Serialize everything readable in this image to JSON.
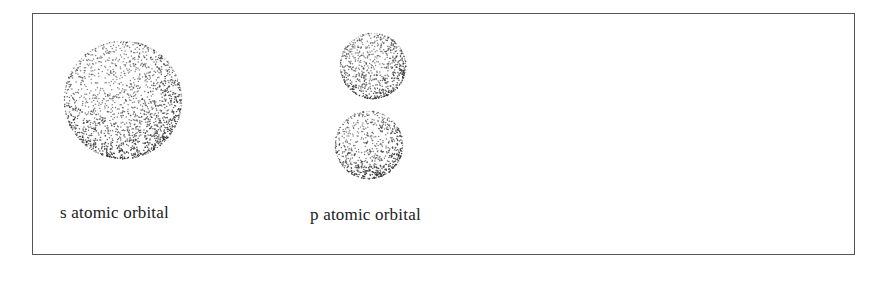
{
  "figure": {
    "orbitals": [
      {
        "id": "s",
        "label": "s atomic orbital",
        "shape": "sphere",
        "lobes": [
          {
            "cx": 123,
            "cy": 100,
            "r": 59
          }
        ],
        "label_pos": {
          "x": 60,
          "y": 203
        }
      },
      {
        "id": "p",
        "label": "p atomic orbital",
        "shape": "dumbbell",
        "lobes": [
          {
            "cx": 373,
            "cy": 66,
            "r": 33
          },
          {
            "cx": 369,
            "cy": 145,
            "r": 34
          }
        ],
        "label_pos": {
          "x": 310,
          "y": 205
        }
      }
    ],
    "stipple_color": "#333333",
    "frame_color": "#555555"
  }
}
